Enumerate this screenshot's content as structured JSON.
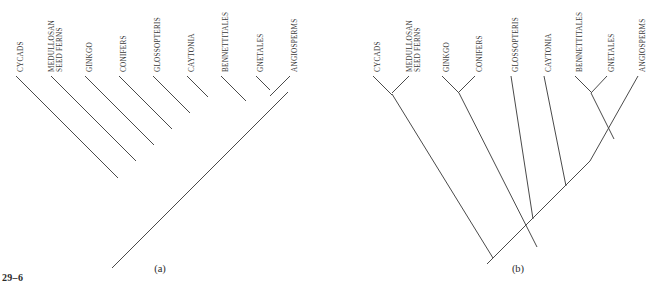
{
  "figure": {
    "number": "29–6",
    "domain_note": "phylogenetic cladogram figure, two alternative seed-plant trees"
  },
  "style": {
    "line_color": "#4a4a4a",
    "text_color": "#3a3a3a",
    "background": "#ffffff",
    "label_rotation_deg": -90
  },
  "panels": [
    {
      "id": "panel-a",
      "caption": "(a)",
      "caption_x": 160,
      "caption_y": 272,
      "topology": "pectinate ladder with terminal Gnetales + Angiosperms pair",
      "root": {
        "x": 118,
        "y": 262
      },
      "taxa": [
        {
          "name": "CYCADS",
          "lines": [
            "CYCADS"
          ],
          "tip_x": 16,
          "tip_y": 76,
          "label_x": 20,
          "label_y": 72
        },
        {
          "name": "MEDULLOSAN SEED FERNS",
          "lines": [
            "MEDULLOSAN",
            "SEED FERNS"
          ],
          "tip_x": 51,
          "tip_y": 76,
          "label_x": 55,
          "label_y": 72
        },
        {
          "name": "GINKGO",
          "lines": [
            "GINKGO"
          ],
          "tip_x": 85,
          "tip_y": 76,
          "label_x": 89,
          "label_y": 72
        },
        {
          "name": "CONIFERS",
          "lines": [
            "CONIFERS"
          ],
          "tip_x": 119,
          "tip_y": 76,
          "label_x": 123,
          "label_y": 72
        },
        {
          "name": "GLOSSOPTERIS",
          "lines": [
            "GLOSSOPTERIS"
          ],
          "tip_x": 153,
          "tip_y": 76,
          "label_x": 157,
          "label_y": 72
        },
        {
          "name": "CAYTONIA",
          "lines": [
            "CAYTONIA"
          ],
          "tip_x": 187,
          "tip_y": 76,
          "label_x": 191,
          "label_y": 72
        },
        {
          "name": "BENNETTITALES",
          "lines": [
            "BENNETTITALES"
          ],
          "tip_x": 221,
          "tip_y": 76,
          "label_x": 225,
          "label_y": 72
        },
        {
          "name": "GNETALES",
          "lines": [
            "GNETALES"
          ],
          "tip_x": 256,
          "tip_y": 76,
          "label_x": 260,
          "label_y": 72
        },
        {
          "name": "ANGIOSPERMS",
          "lines": [
            "ANGIOSPERMS"
          ],
          "tip_x": 290,
          "tip_y": 76,
          "label_x": 294,
          "label_y": 72
        }
      ],
      "segments": [
        {
          "name": "backbone-root-stub",
          "x1": 112,
          "y1": 268,
          "x2": 123,
          "y2": 257
        },
        {
          "name": "backbone-main",
          "x1": 118,
          "y1": 262,
          "x2": 288,
          "y2": 92
        },
        {
          "name": "tip-branch-cycads",
          "x1": 16,
          "y1": 76,
          "x2": 118,
          "y2": 178
        },
        {
          "name": "tip-branch-medullosan",
          "x1": 51,
          "y1": 76,
          "x2": 136,
          "y2": 161
        },
        {
          "name": "tip-branch-ginkgo",
          "x1": 85,
          "y1": 76,
          "x2": 154,
          "y2": 145
        },
        {
          "name": "tip-branch-conifers",
          "x1": 119,
          "y1": 76,
          "x2": 172,
          "y2": 129
        },
        {
          "name": "tip-branch-glossopteris",
          "x1": 153,
          "y1": 76,
          "x2": 190,
          "y2": 113
        },
        {
          "name": "tip-branch-caytonia",
          "x1": 187,
          "y1": 76,
          "x2": 208,
          "y2": 97
        },
        {
          "name": "tip-branch-bennettitales",
          "x1": 221,
          "y1": 76,
          "x2": 246,
          "y2": 101
        },
        {
          "name": "tip-branch-gnetales",
          "x1": 256,
          "y1": 76,
          "x2": 270,
          "y2": 90
        },
        {
          "name": "tip-branch-angiosperms",
          "x1": 290,
          "y1": 76,
          "x2": 270,
          "y2": 96
        }
      ]
    },
    {
      "id": "panel-b",
      "caption": "(b)",
      "caption_x": 518,
      "caption_y": 272,
      "topology": "nested tree with three sister pairs: cycads+medullosans, ginkgo+conifers, bennettitales+gnetales",
      "root": {
        "x": 493,
        "y": 258
      },
      "taxa": [
        {
          "name": "CYCADS",
          "lines": [
            "CYCADS"
          ],
          "tip_x": 373,
          "tip_y": 76,
          "label_x": 377,
          "label_y": 72
        },
        {
          "name": "MEDULLOSAN SEED FERNS",
          "lines": [
            "MEDULLOSAN",
            "SEED FERNS"
          ],
          "tip_x": 409,
          "tip_y": 76,
          "label_x": 413,
          "label_y": 72
        },
        {
          "name": "GINKGO",
          "lines": [
            "GINKGO"
          ],
          "tip_x": 442,
          "tip_y": 76,
          "label_x": 446,
          "label_y": 72
        },
        {
          "name": "CONIFERS",
          "lines": [
            "CONIFERS"
          ],
          "tip_x": 475,
          "tip_y": 76,
          "label_x": 479,
          "label_y": 72
        },
        {
          "name": "GLOSSOPTERIS",
          "lines": [
            "GLOSSOPTERIS"
          ],
          "tip_x": 511,
          "tip_y": 76,
          "label_x": 515,
          "label_y": 72
        },
        {
          "name": "CAYTONIA",
          "lines": [
            "CAYTONIA"
          ],
          "tip_x": 544,
          "tip_y": 76,
          "label_x": 548,
          "label_y": 72
        },
        {
          "name": "BENNETTITALES",
          "lines": [
            "BENNETTITALES"
          ],
          "tip_x": 575,
          "tip_y": 76,
          "label_x": 579,
          "label_y": 72
        },
        {
          "name": "GNETALES",
          "lines": [
            "GNETALES"
          ],
          "tip_x": 607,
          "tip_y": 76,
          "label_x": 611,
          "label_y": 72
        },
        {
          "name": "ANGIOSPERMS",
          "lines": [
            "ANGIOSPERMS"
          ],
          "tip_x": 638,
          "tip_y": 76,
          "label_x": 642,
          "label_y": 72
        }
      ],
      "segments": [
        {
          "name": "root-stub",
          "x1": 487,
          "y1": 264,
          "x2": 498,
          "y2": 253
        },
        {
          "name": "node-cycad-pair-left",
          "x1": 373,
          "y1": 76,
          "x2": 392,
          "y2": 95
        },
        {
          "name": "node-cycad-pair-right",
          "x1": 409,
          "y1": 76,
          "x2": 392,
          "y2": 93
        },
        {
          "name": "stem-cycad-clade",
          "x1": 392,
          "y1": 94,
          "x2": 493,
          "y2": 258
        },
        {
          "name": "node-ginkgo-pair-left",
          "x1": 442,
          "y1": 76,
          "x2": 459,
          "y2": 93
        },
        {
          "name": "node-ginkgo-pair-right",
          "x1": 475,
          "y1": 76,
          "x2": 459,
          "y2": 92
        },
        {
          "name": "stem-ginkgo-clade",
          "x1": 459,
          "y1": 93,
          "x2": 537,
          "y2": 247
        },
        {
          "name": "backbone-core",
          "x1": 493,
          "y1": 258,
          "x2": 590,
          "y2": 161
        },
        {
          "name": "tip-branch-glossopteris",
          "x1": 511,
          "y1": 76,
          "x2": 533,
          "y2": 219
        },
        {
          "name": "tip-branch-caytonia",
          "x1": 544,
          "y1": 76,
          "x2": 566,
          "y2": 186
        },
        {
          "name": "node-bennett-gnetales-left",
          "x1": 575,
          "y1": 76,
          "x2": 591,
          "y2": 92
        },
        {
          "name": "node-bennett-gnetales-right",
          "x1": 607,
          "y1": 76,
          "x2": 591,
          "y2": 93
        },
        {
          "name": "stem-bennett-gnetales",
          "x1": 591,
          "y1": 93,
          "x2": 614,
          "y2": 139
        },
        {
          "name": "tip-branch-angiosperms",
          "x1": 638,
          "y1": 76,
          "x2": 590,
          "y2": 161
        }
      ]
    }
  ]
}
